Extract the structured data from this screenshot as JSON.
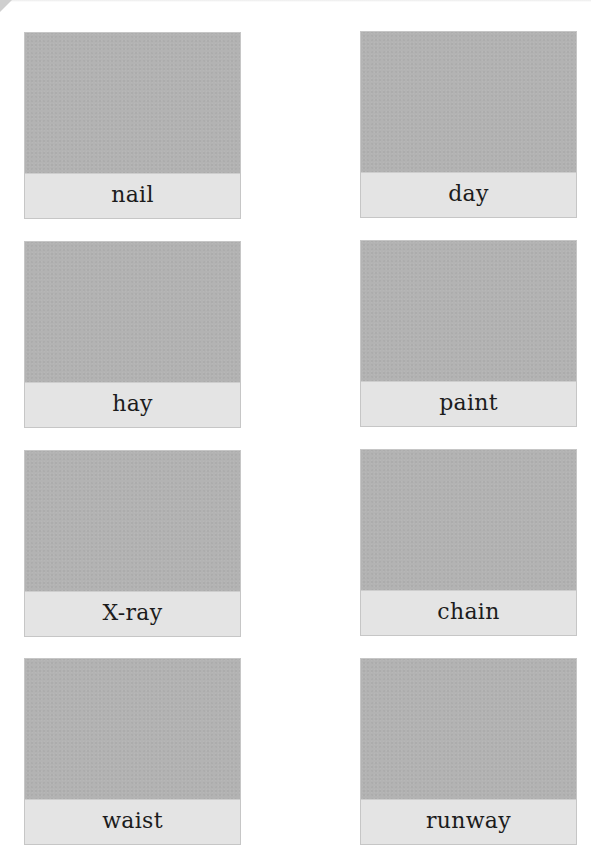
{
  "worksheet": {
    "cards": [
      {
        "word": "nail",
        "column": "left",
        "row": 1
      },
      {
        "word": "day",
        "column": "right",
        "row": 1
      },
      {
        "word": "hay",
        "column": "left",
        "row": 2
      },
      {
        "word": "paint",
        "column": "right",
        "row": 2
      },
      {
        "word": "X-ray",
        "column": "left",
        "row": 3
      },
      {
        "word": "chain",
        "column": "right",
        "row": 3
      },
      {
        "word": "waist",
        "column": "left",
        "row": 4
      },
      {
        "word": "runway",
        "column": "right",
        "row": 4
      }
    ],
    "colors": {
      "picture_placeholder": "#b3b3b3",
      "label_band": "#e4e4e4",
      "card_border": "#c6c6c6",
      "text": "#1c1c1c",
      "page": "#ffffff"
    }
  }
}
